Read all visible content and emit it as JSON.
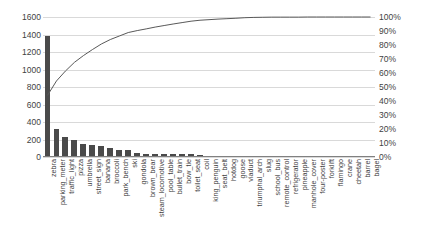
{
  "chart_data": {
    "type": "bar",
    "title": "",
    "subtitle": "",
    "xlabel": "",
    "ylabel": "",
    "y2label": "",
    "grid": true,
    "legend": "none",
    "ylim": [
      0,
      1600
    ],
    "y2lim": [
      0,
      100
    ],
    "yticks": [
      0,
      200,
      400,
      600,
      800,
      1000,
      1200,
      1400,
      1600
    ],
    "ytick_labels": [
      "0",
      "200",
      "400",
      "600",
      "800",
      "1000",
      "1200",
      "1400",
      "1600"
    ],
    "y2ticks": [
      0,
      10,
      20,
      30,
      40,
      50,
      60,
      70,
      80,
      90,
      100
    ],
    "y2tick_labels": [
      "0%",
      "10%",
      "20%",
      "30%",
      "40%",
      "50%",
      "60%",
      "70%",
      "80%",
      "90%",
      "100%"
    ],
    "bar_color": "#4a4a4a",
    "line_color": "#595959",
    "grid_color": "#d9d9d9",
    "categories": [
      "zebra",
      "parking_meter",
      "traffic_light",
      "pizza",
      "umbrella",
      "street_sign",
      "banana",
      "broccoli",
      "park_bench",
      "ski",
      "gondola",
      "brown_bear",
      "steam_locomotive",
      "pool_table",
      "bullet_train",
      "bow_tie",
      "toilet_seat",
      "coil",
      "king_penguin",
      "seat_belt",
      "hotdog",
      "goose",
      "viaduct",
      "triumphal_arch",
      "slug",
      "school_bus",
      "remote_control",
      "refrigerator",
      "pineapple",
      "manhole_cover",
      "four-poster",
      "forklift",
      "flamingo",
      "crane",
      "cheetah",
      "barrel",
      "bagel"
    ],
    "values": [
      1385,
      325,
      225,
      195,
      150,
      135,
      125,
      100,
      80,
      80,
      42,
      40,
      38,
      36,
      34,
      32,
      30,
      22,
      14,
      12,
      11,
      10,
      10,
      9,
      8,
      8,
      7,
      7,
      6,
      6,
      5,
      5,
      4,
      4,
      3,
      3,
      2
    ],
    "cumulative_percent": [
      44.0,
      54.3,
      61.4,
      67.6,
      72.4,
      76.7,
      80.7,
      83.9,
      86.4,
      88.9,
      90.3,
      91.5,
      92.8,
      93.9,
      95.0,
      96.0,
      97.0,
      97.7,
      98.1,
      98.5,
      98.8,
      99.1,
      99.5,
      99.7,
      99.8,
      99.9,
      99.9,
      99.9,
      99.9,
      100.0,
      100.0,
      100.0,
      100.0,
      100.0,
      100.0,
      100.0,
      100.0
    ]
  }
}
